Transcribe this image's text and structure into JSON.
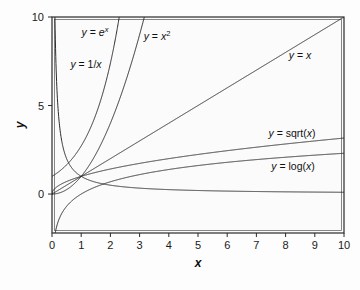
{
  "chart_data": {
    "type": "line",
    "title": "",
    "xlabel": "x",
    "ylabel": "y",
    "xlim": [
      0,
      10
    ],
    "ylim": [
      -2.2,
      10
    ],
    "grid": false,
    "legend_position": "inline-labels",
    "xticks": [
      0,
      1,
      2,
      3,
      4,
      5,
      6,
      7,
      8,
      9,
      10
    ],
    "xticklabels": [
      "0",
      "1",
      "2",
      "3",
      "4",
      "5",
      "6",
      "7",
      "8",
      "9",
      "10"
    ],
    "yticks": [
      0,
      5,
      10
    ],
    "yticklabels": [
      "0",
      "5",
      "10"
    ],
    "series": [
      {
        "name": "y = e^x",
        "formula": "exp",
        "label_parts": [
          {
            "text": "y",
            "style": "italic"
          },
          {
            "text": " = ",
            "style": "roman"
          },
          {
            "text": "e",
            "style": "italic"
          },
          {
            "text": "x",
            "style": "italic-sup"
          }
        ],
        "label_x": 95,
        "label_y": 36
      },
      {
        "name": "y = x^2",
        "formula": "square",
        "label_parts": [
          {
            "text": "y",
            "style": "italic"
          },
          {
            "text": " = ",
            "style": "roman"
          },
          {
            "text": "x",
            "style": "italic"
          },
          {
            "text": "2",
            "style": "roman-sup"
          }
        ],
        "label_x": 157,
        "label_y": 40
      },
      {
        "name": "y = 1/x",
        "formula": "reciprocal",
        "label_parts": [
          {
            "text": "y",
            "style": "italic"
          },
          {
            "text": " = 1/",
            "style": "roman"
          },
          {
            "text": "x",
            "style": "italic"
          }
        ],
        "label_x": 86,
        "label_y": 68
      },
      {
        "name": "y = x",
        "formula": "linear",
        "label_parts": [
          {
            "text": "y",
            "style": "italic"
          },
          {
            "text": " = ",
            "style": "roman"
          },
          {
            "text": "x",
            "style": "italic"
          }
        ],
        "label_x": 300,
        "label_y": 59
      },
      {
        "name": "y = sqrt(x)",
        "formula": "sqrt",
        "label_parts": [
          {
            "text": "y",
            "style": "italic"
          },
          {
            "text": " = sqrt(",
            "style": "roman"
          },
          {
            "text": "x",
            "style": "italic"
          },
          {
            "text": ")",
            "style": "roman"
          }
        ],
        "label_x": 292,
        "label_y": 137
      },
      {
        "name": "y = log(x)",
        "formula": "log",
        "label_parts": [
          {
            "text": "y",
            "style": "italic"
          },
          {
            "text": " = log(",
            "style": "roman"
          },
          {
            "text": "x",
            "style": "italic"
          },
          {
            "text": ")",
            "style": "roman"
          }
        ],
        "label_x": 293,
        "label_y": 170
      }
    ],
    "colors": {
      "curve": "#2a2a2a",
      "frame": "#2b2b2b",
      "background": "#fbfbfb",
      "text": "#111111"
    }
  },
  "plot_geometry": {
    "left": 52,
    "right": 344,
    "top": 17,
    "bottom": 233
  }
}
